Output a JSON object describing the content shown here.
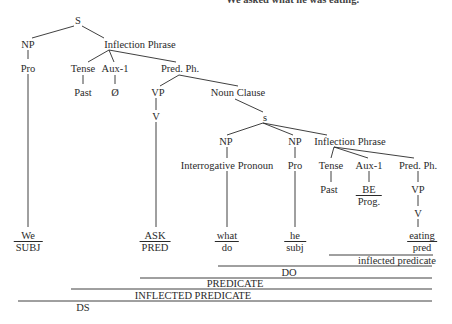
{
  "caption": "We asked what he was eating.",
  "tree": {
    "root": "S",
    "np1": "NP",
    "infl1": "Inflection Phrase",
    "pro1": "Pro",
    "tense1": "Tense",
    "aux1": "Aux-1",
    "pred1": "Pred. Ph.",
    "past1": "Past",
    "null1": "Ø",
    "vp1": "VP",
    "noun_clause": "Noun Clause",
    "v1": "V",
    "s2": "s",
    "np2": "NP",
    "np3": "NP",
    "infl2": "Inflection Phrase",
    "interrog": "Interrogative Pronoun",
    "pro2": "Pro",
    "tense2": "Tense",
    "aux2": "Aux-1",
    "pred2": "Pred. Ph.",
    "past2": "Past",
    "be": "BE",
    "prog": "Prog.",
    "vp2": "VP",
    "v2": "V"
  },
  "leaves": [
    {
      "word": "We",
      "role": "SUBJ"
    },
    {
      "word": "ASK",
      "role": "PRED"
    },
    {
      "word": "what",
      "role": "do"
    },
    {
      "word": "he",
      "role": "subj"
    },
    {
      "word": "eating",
      "role": "pred"
    }
  ],
  "bands": {
    "inflected_predicate_lower": "inflected predicate",
    "do": "DO",
    "predicate": "PREDICATE",
    "inflected_predicate_upper": "INFLECTED PREDICATE",
    "ds": "DS"
  }
}
